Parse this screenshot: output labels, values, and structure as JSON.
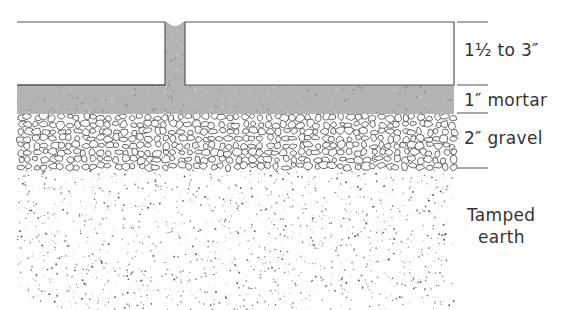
{
  "diagram": {
    "type": "cross-section",
    "layers": [
      {
        "name": "brick",
        "label": "1½ to 3″",
        "fill": "#ffffff"
      },
      {
        "name": "mortar",
        "label": "1″ mortar",
        "fill": "#b4b4b4"
      },
      {
        "name": "gravel",
        "label": "2″ gravel",
        "fill": "#ffffff"
      },
      {
        "name": "earth",
        "label": "Tamped\nearth",
        "fill": "#ffffff"
      }
    ],
    "labels": {
      "brick": "1½ to 3″",
      "mortar": "1″ mortar",
      "gravel": "2″ gravel",
      "earth_line1": "Tamped",
      "earth_line2": "earth"
    },
    "colors": {
      "outline": "#555555",
      "mortar": "#b4b4b4",
      "text": "#333333"
    }
  }
}
